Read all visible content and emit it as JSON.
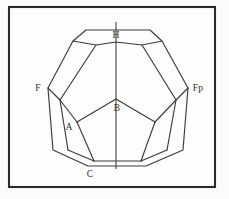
{
  "figure": {
    "background_color": "#fbfbf9",
    "frame_color": "#2b2b2b",
    "edge_color": "#3a3a3a",
    "axis_color": "#4a4a4a",
    "label_color": "#2e2e2e",
    "frame": {
      "x": 8,
      "y": 6,
      "width": 208,
      "height": 182
    },
    "axis": {
      "x": 116,
      "y_top": 22,
      "y_bottom": 169
    }
  },
  "labels": [
    {
      "id": "H",
      "text": "H",
      "x": 116,
      "y": 38,
      "anchor": "middle"
    },
    {
      "id": "F",
      "text": "F",
      "x": 38,
      "y": 91,
      "anchor": "middle"
    },
    {
      "id": "Fp",
      "text": "Fp",
      "x": 198,
      "y": 91,
      "anchor": "middle"
    },
    {
      "id": "B",
      "text": "B",
      "x": 117,
      "y": 111,
      "anchor": "middle"
    },
    {
      "id": "A",
      "text": "A",
      "x": 69,
      "y": 130,
      "anchor": "middle"
    },
    {
      "id": "C",
      "text": "C",
      "x": 90,
      "y": 177,
      "anchor": "middle"
    }
  ],
  "vertices": {
    "top_left": {
      "x": 86,
      "y": 30
    },
    "top_right": {
      "x": 150,
      "y": 30
    },
    "upper_left": {
      "x": 73,
      "y": 41
    },
    "upper_right": {
      "x": 162,
      "y": 41
    },
    "ridge_left": {
      "x": 96,
      "y": 45
    },
    "ridge_right": {
      "x": 142,
      "y": 45
    },
    "H_vertex": {
      "x": 116,
      "y": 42
    },
    "F": {
      "x": 48,
      "y": 88
    },
    "F_inner": {
      "x": 53,
      "y": 92
    },
    "Fp": {
      "x": 188,
      "y": 88
    },
    "Fp_inner": {
      "x": 183,
      "y": 92
    },
    "B": {
      "x": 116,
      "y": 99
    },
    "A": {
      "x": 77,
      "y": 122
    },
    "A_right": {
      "x": 155,
      "y": 122
    },
    "left_low": {
      "x": 68,
      "y": 150
    },
    "right_low": {
      "x": 167,
      "y": 150
    },
    "C": {
      "x": 88,
      "y": 166
    },
    "bottom_right": {
      "x": 146,
      "y": 166
    },
    "bottom_inner_l": {
      "x": 94,
      "y": 161
    },
    "bottom_inner_r": {
      "x": 141,
      "y": 161
    }
  },
  "polylines": {
    "outer_outline": "86,30 150,30 162,41 188,88 183,150 146,166 88,166 53,150 48,88 73,41 86,30",
    "top_ridge": "73,41 96,45 116,42 142,45 162,41",
    "h_stem": "116,42 116,45",
    "left_upper_face": "96,45 60,100 77,122",
    "right_upper_face": "142,45 176,100 155,122",
    "center_pentagon_left": "77,122 116,99",
    "center_pentagon_right": "116,99 155,122",
    "center_left_arm": "60,100 77,122",
    "left_seam_f": "48,88 60,100",
    "right_seam_fp": "188,88 176,100",
    "left_lower_seam": "60,100 68,150",
    "right_lower_seam": "176,100 167,150",
    "bottom_left_face": "77,122 94,161",
    "bottom_right_face": "155,122 141,161",
    "bottom_inner_edge": "94,161 141,161",
    "lower_left_join": "68,150 88,166",
    "lower_right_join": "167,150 146,166",
    "bottom_edge": "88,166 146,166",
    "bl_corner": "68,150 94,161",
    "br_corner": "167,150 141,161"
  }
}
